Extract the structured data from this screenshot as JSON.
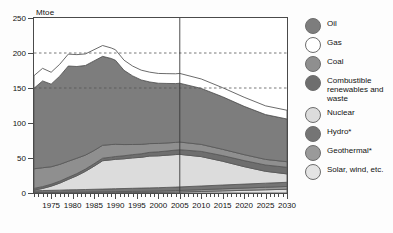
{
  "chart_data": {
    "type": "area",
    "title": "",
    "subtitle": "",
    "xlabel": "",
    "ylabel": "Mtoe",
    "unit_label": "Mtoe",
    "stacked": true,
    "grid": "horizontal-dashed",
    "gridlines": [
      150,
      200
    ],
    "legend_position": "right",
    "xlim": [
      1971,
      2030
    ],
    "ylim": [
      0,
      250
    ],
    "yticks": [
      0,
      50,
      100,
      150,
      200,
      250
    ],
    "xticks": [
      1975,
      1980,
      1985,
      1990,
      1995,
      2000,
      2005,
      2010,
      2015,
      2020,
      2025,
      2030
    ],
    "xtick_interval_minor": 1,
    "projection_divider_year": 2005,
    "x": [
      1971,
      1973,
      1975,
      1977,
      1979,
      1981,
      1983,
      1985,
      1987,
      1989,
      1990,
      1992,
      1994,
      1996,
      1998,
      2000,
      2002,
      2004,
      2005,
      2010,
      2015,
      2020,
      2025,
      2030
    ],
    "series": [
      {
        "name": "Solar, wind, etc.",
        "color": "#e4e4e4",
        "values": [
          0.2,
          0.2,
          0.2,
          0.2,
          0.3,
          0.3,
          0.3,
          0.4,
          0.4,
          0.5,
          0.5,
          0.6,
          0.7,
          0.8,
          0.9,
          1.0,
          1.2,
          1.4,
          1.5,
          2.2,
          3.0,
          3.8,
          4.6,
          5.4
        ]
      },
      {
        "name": "Geothermal*",
        "color": "#9a9a9a",
        "values": [
          0.4,
          0.5,
          0.6,
          0.7,
          0.8,
          0.9,
          1.0,
          1.1,
          1.2,
          1.3,
          1.4,
          1.5,
          1.6,
          1.7,
          1.8,
          1.9,
          2.0,
          2.1,
          2.2,
          2.6,
          3.0,
          3.3,
          3.6,
          3.9
        ]
      },
      {
        "name": "Hydro*",
        "color": "#757575",
        "values": [
          2.5,
          2.8,
          3.0,
          3.2,
          3.4,
          3.5,
          3.7,
          3.8,
          4.0,
          4.1,
          4.2,
          4.3,
          4.4,
          4.5,
          4.6,
          4.7,
          4.8,
          4.9,
          5.0,
          5.2,
          5.4,
          5.6,
          5.8,
          6.0
        ]
      },
      {
        "name": "Nuclear",
        "color": "#dcdcdc",
        "values": [
          1.0,
          3.0,
          6.0,
          10.0,
          15.0,
          20.0,
          26.0,
          33.0,
          40.5,
          41.5,
          42.0,
          42.5,
          43.5,
          44.0,
          45.5,
          45.5,
          46.0,
          46.5,
          46.5,
          42.0,
          34.0,
          25.0,
          17.0,
          12.0
        ]
      },
      {
        "name": "Combustible renewables and waste",
        "color": "#6e6e6e",
        "values": [
          2.5,
          2.6,
          2.7,
          2.8,
          2.9,
          3.0,
          3.2,
          3.4,
          3.6,
          3.8,
          4.0,
          4.3,
          4.6,
          5.0,
          5.3,
          5.7,
          6.0,
          6.4,
          6.6,
          7.4,
          8.0,
          8.6,
          9.0,
          9.4
        ]
      },
      {
        "name": "Coal",
        "color": "#8f8f8f",
        "values": [
          28.0,
          27.0,
          25.0,
          24.0,
          23.0,
          22.0,
          20.0,
          19.0,
          18.5,
          18.0,
          17.5,
          16.0,
          14.5,
          13.5,
          12.5,
          12.0,
          11.5,
          11.0,
          11.0,
          10.0,
          9.0,
          8.5,
          8.0,
          8.0
        ]
      },
      {
        "name": "Oil",
        "color": "#7d7d7d",
        "values": [
          115.0,
          124.0,
          118.0,
          126.0,
          136.0,
          131.0,
          128.0,
          128.0,
          127.0,
          123.0,
          120.0,
          106.0,
          98.0,
          92.0,
          88.0,
          86.0,
          85.0,
          84.0,
          84.0,
          80.0,
          75.0,
          69.0,
          64.0,
          61.0
        ]
      },
      {
        "name": "Gas",
        "color": "#ffffff",
        "values": [
          18.0,
          18.0,
          17.0,
          17.0,
          17.0,
          17.0,
          16.5,
          16.0,
          15.5,
          15.0,
          15.0,
          14.5,
          14.0,
          14.0,
          14.0,
          14.0,
          14.0,
          14.0,
          14.0,
          13.5,
          13.0,
          13.0,
          12.5,
          12.5
        ]
      }
    ],
    "series_render_order_bottom_to_top": [
      "Solar, wind, etc.",
      "Geothermal*",
      "Hydro*",
      "Nuclear",
      "Combustible renewables and waste",
      "Coal",
      "Oil",
      "Gas"
    ]
  },
  "legend": {
    "items": [
      {
        "label": "Oil",
        "color": "#7d7d7d"
      },
      {
        "label": "Gas",
        "color": "#ffffff"
      },
      {
        "label": "Coal",
        "color": "#8f8f8f"
      },
      {
        "label": "Combustible renewables and waste",
        "color": "#6e6e6e"
      },
      {
        "label": "Nuclear",
        "color": "#dcdcdc"
      },
      {
        "label": "Hydro*",
        "color": "#757575"
      },
      {
        "label": "Geothermal*",
        "color": "#9a9a9a"
      },
      {
        "label": "Solar, wind, etc.",
        "color": "#e4e4e4"
      }
    ]
  }
}
